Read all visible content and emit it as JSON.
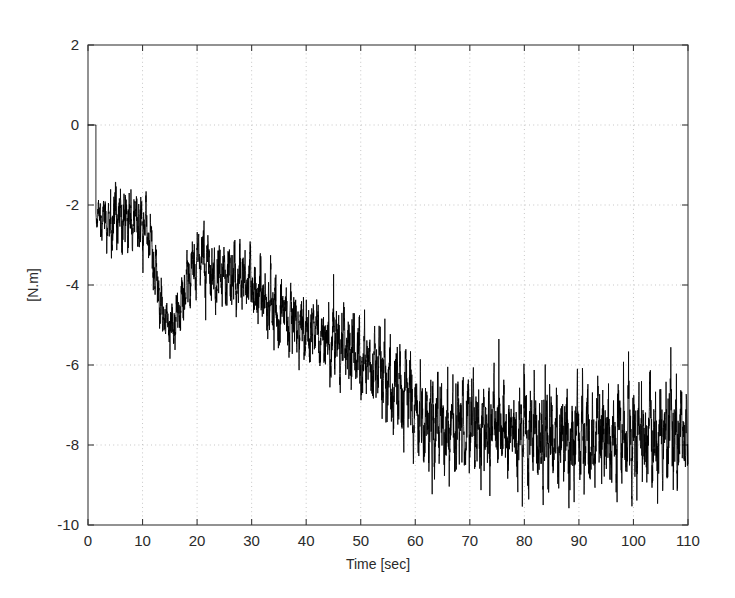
{
  "chart_data": {
    "type": "line",
    "title": "",
    "subtitle": "",
    "xlabel": "Time [sec]",
    "ylabel": "[N.m]",
    "xlim": [
      0,
      110
    ],
    "ylim": [
      -10,
      2
    ],
    "xticks": [
      0,
      10,
      20,
      30,
      40,
      50,
      60,
      70,
      80,
      90,
      100,
      110
    ],
    "xticklabels": [
      "0",
      "10",
      "20",
      "30",
      "40",
      "50",
      "60",
      "70",
      "80",
      "90",
      "100",
      "110"
    ],
    "yticks": [
      2,
      0,
      -2,
      -4,
      -6,
      -8,
      -10
    ],
    "yticklabels": [
      "2",
      "0",
      "-2",
      "-4",
      "-6",
      "-8",
      "-10"
    ],
    "grid": true,
    "grid_style": "dotted",
    "grid_color": "#b9b9b9",
    "legend": null,
    "legend_position": "none",
    "series": [
      {
        "name": "torque",
        "color": "#000000",
        "linewidth": 0.85,
        "description": "Noisy torque signal: starts at 0 N.m, drops abruptly to about -2.3 N.m near t=1.5 s, fluctuates around -2.5 N.m until t=11 s, steps down to about -5.2 N.m between t=13 and t=17 s, partially recovers to about -3.5 N.m with a spike to -1.6 N.m at t=21 s, then ramps steadily downward reaching about -8 N.m near t=62 s, after which it oscillates in a band between -6.5 and -9.5 N.m with increasing peak-to-peak amplitude until t=110 s.",
        "mean_envelope_x": [
          0,
          1.5,
          4,
          7,
          10,
          11.5,
          13,
          15,
          17,
          19,
          21,
          23,
          26,
          29,
          32,
          35,
          38,
          41,
          44,
          47,
          50,
          53,
          56,
          59,
          62,
          66,
          70,
          74,
          78,
          82,
          86,
          90,
          94,
          98,
          102,
          106,
          110
        ],
        "mean_envelope_y": [
          0,
          -2.3,
          -2.5,
          -2.3,
          -2.4,
          -2.9,
          -4.3,
          -5.1,
          -4.6,
          -3.6,
          -3.3,
          -3.8,
          -3.7,
          -3.9,
          -4.3,
          -4.7,
          -5.0,
          -5.2,
          -5.4,
          -5.4,
          -5.8,
          -6.1,
          -6.4,
          -6.9,
          -7.5,
          -7.6,
          -7.5,
          -7.5,
          -7.6,
          -7.7,
          -7.9,
          -7.9,
          -7.8,
          -7.7,
          -7.8,
          -7.8,
          -7.7
        ],
        "noise_amplitude_x": [
          0,
          2,
          6,
          11,
          14,
          18,
          22,
          28,
          34,
          40,
          46,
          52,
          58,
          62,
          68,
          74,
          80,
          86,
          92,
          98,
          104,
          110
        ],
        "noise_amplitude_y": [
          0.0,
          0.45,
          0.75,
          0.55,
          0.55,
          0.6,
          0.8,
          0.75,
          0.7,
          0.75,
          0.85,
          0.9,
          0.95,
          1.05,
          1.0,
          1.05,
          1.05,
          1.15,
          1.2,
          1.15,
          1.15,
          1.1
        ],
        "notable_points": [
          {
            "t": 0.0,
            "v": 0.0,
            "note": "signal origin at zero"
          },
          {
            "t": 5.8,
            "v": -0.75,
            "note": "early positive-going peak"
          },
          {
            "t": 16.2,
            "v": -5.7,
            "note": "local minimum of first step-down"
          },
          {
            "t": 21.2,
            "v": -1.6,
            "note": "large upward spike"
          },
          {
            "t": 61.5,
            "v": -9.2,
            "note": "deep excursion at onset of steady band"
          },
          {
            "t": 91.5,
            "v": -9.5,
            "note": "global minimum"
          },
          {
            "t": 97.0,
            "v": -6.4,
            "note": "upper band peak"
          },
          {
            "t": 110.0,
            "v": -6.4,
            "note": "final sample at right edge"
          }
        ]
      }
    ]
  },
  "figure": {
    "background_color": "#ffffff",
    "axis_color": "#3a3a3a",
    "trace_color": "#000000"
  }
}
